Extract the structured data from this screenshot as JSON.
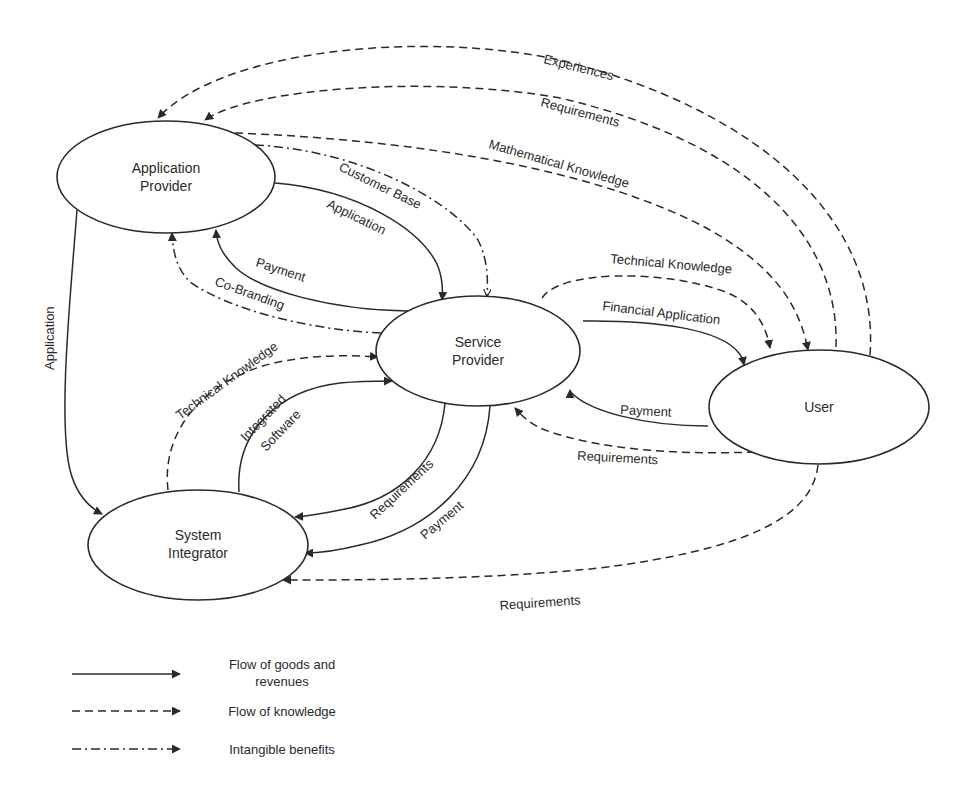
{
  "nodes": {
    "application_provider": {
      "line1": "Application",
      "line2": "Provider"
    },
    "service_provider": {
      "line1": "Service",
      "line2": "Provider"
    },
    "user": {
      "line1": "User"
    },
    "system_integrator": {
      "line1": "System",
      "line2": "Integrator"
    }
  },
  "edges": {
    "experiences": {
      "label": "Experiences",
      "from": "User",
      "to": "Application Provider",
      "type": "knowledge"
    },
    "requirements_user_ap": {
      "label": "Requirements",
      "from": "User",
      "to": "Application Provider",
      "type": "knowledge"
    },
    "mathematical_knowledge": {
      "label": "Mathematical Knowledge",
      "from": "Application Provider",
      "to": "User",
      "type": "knowledge"
    },
    "customer_base": {
      "label": "Customer Base",
      "from": "Application Provider",
      "to": "Service Provider",
      "type": "intangible"
    },
    "application_ap_sp": {
      "label": "Application",
      "from": "Application Provider",
      "to": "Service Provider",
      "type": "goods"
    },
    "payment_sp_ap": {
      "label": "Payment",
      "from": "Service Provider",
      "to": "Application Provider",
      "type": "goods"
    },
    "co_branding": {
      "label": "Co-Branding",
      "from": "Service Provider",
      "to": "Application Provider",
      "type": "intangible"
    },
    "application_ap_si": {
      "label": "Application",
      "from": "Application Provider",
      "to": "System Integrator",
      "type": "goods"
    },
    "technical_knowledge_sp_user": {
      "label": "Technical Knowledge",
      "from": "Service Provider",
      "to": "User",
      "type": "knowledge"
    },
    "financial_application": {
      "label": "Financial Application",
      "from": "Service Provider",
      "to": "User",
      "type": "goods"
    },
    "payment_user_sp": {
      "label": "Payment",
      "from": "User",
      "to": "Service Provider",
      "type": "goods"
    },
    "requirements_user_sp": {
      "label": "Requirements",
      "from": "User",
      "to": "Service Provider",
      "type": "knowledge"
    },
    "technical_knowledge_si_sp": {
      "label": "Technical Knowledge",
      "from": "System Integrator",
      "to": "Service Provider",
      "type": "knowledge"
    },
    "integrated_software": {
      "line1": "Integrated",
      "line2": "Software",
      "from": "System Integrator",
      "to": "Service Provider",
      "type": "goods"
    },
    "requirements_sp_si": {
      "label": "Requirements",
      "from": "Service Provider",
      "to": "System Integrator",
      "type": "goods"
    },
    "payment_sp_si": {
      "label": "Payment",
      "from": "Service Provider",
      "to": "System Integrator",
      "type": "goods"
    },
    "requirements_user_si": {
      "label": "Requirements",
      "from": "User",
      "to": "System Integrator",
      "type": "knowledge"
    }
  },
  "legend": {
    "goods": {
      "line1": "Flow of goods and",
      "line2": "revenues"
    },
    "knowledge": {
      "label": "Flow of knowledge"
    },
    "intangible": {
      "label": "Intangible benefits"
    }
  },
  "colors": {
    "ink": "#2a2a2a",
    "background": "#ffffff"
  }
}
